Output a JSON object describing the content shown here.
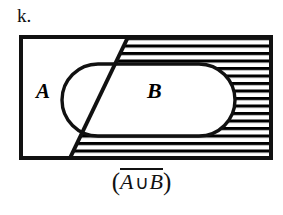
{
  "figure": {
    "item_label": "k.",
    "caption": {
      "open_paren": "(",
      "left_set": "A",
      "operator": "∪",
      "right_set": "B",
      "close_paren": ")",
      "full_text": "(A ∪ B) complement"
    },
    "labels": {
      "set_a": "A",
      "set_b": "B"
    },
    "colors": {
      "ink": "#111111",
      "background": "#ffffff",
      "hatch": "#000000"
    },
    "geometry": {
      "universe_rect": {
        "x": 21,
        "y": 37,
        "width": 250,
        "height": 121
      },
      "stadium": {
        "x": 62,
        "y": 64,
        "width": 173,
        "height": 72,
        "radius": 36
      },
      "diagonal": {
        "x1": 128,
        "y1": 37,
        "x2": 70,
        "y2": 158
      },
      "hatch_spacing": 7.5,
      "hatch_line_width": 3,
      "border_width": 4
    },
    "semantics": {
      "shaded_region_name": "complement-of-a-union-b",
      "universe_name": "universal-set-rectangle",
      "region_a_name": "set-a-region",
      "region_b_name": "set-b-region"
    }
  }
}
